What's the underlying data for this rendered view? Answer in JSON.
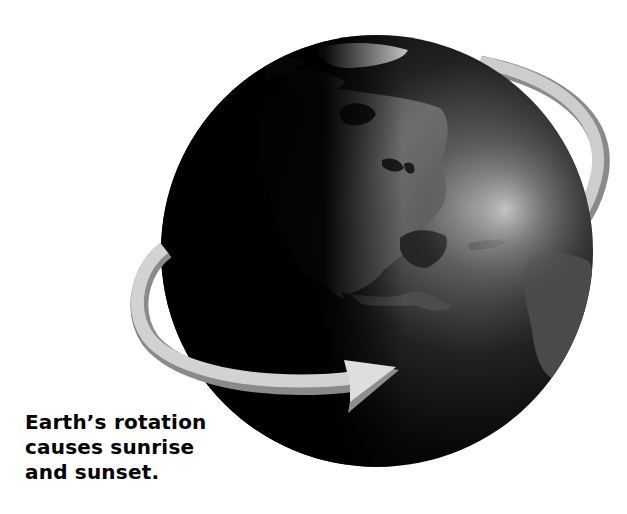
{
  "header": {
    "cut_off_title": "Day and Night Cycle by Earth"
  },
  "illustration": {
    "subject": "Earth globe showing North America",
    "style": "grayscale",
    "globe": {
      "center_x": 377,
      "center_y": 251,
      "radius": 216,
      "base_color": "#050505",
      "highlight_color": "#b8b8b8"
    },
    "rotation_arrow": {
      "direction": "counter-clockwise (west to east)",
      "face_color": "#cfcfcf",
      "edge_color": "#8a8a8a"
    }
  },
  "caption": {
    "lines": [
      "Earth’s rotation",
      "causes sunrise",
      "and sunset."
    ]
  }
}
